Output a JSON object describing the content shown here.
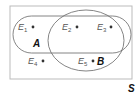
{
  "diagram": {
    "type": "venn",
    "universe_label": "S",
    "sets": [
      {
        "name": "A",
        "label": "A",
        "shape": "stadium"
      },
      {
        "name": "B",
        "label": "B",
        "shape": "ellipse"
      }
    ],
    "outcomes": [
      {
        "id": "E1",
        "letter": "E",
        "sub": "1",
        "region": "A only"
      },
      {
        "id": "E2",
        "letter": "E",
        "sub": "2",
        "region": "A and B"
      },
      {
        "id": "E3",
        "letter": "E",
        "sub": "3",
        "region": "A and B"
      },
      {
        "id": "E4",
        "letter": "E",
        "sub": "4",
        "region": "neither"
      },
      {
        "id": "E5",
        "letter": "E",
        "sub": "5",
        "region": "B only"
      }
    ],
    "colors": {
      "stroke": "#666666",
      "frame": "#bbbbbb",
      "text": "#555555",
      "set_label": "#111111"
    }
  }
}
